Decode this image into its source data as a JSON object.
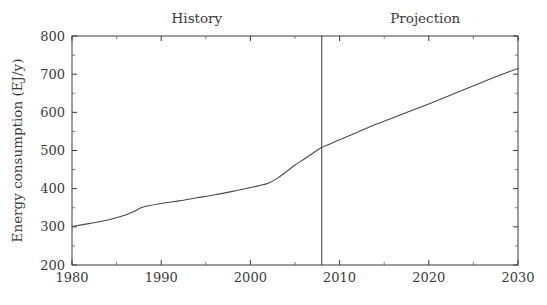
{
  "chart_data": {
    "type": "line",
    "title": "",
    "subtitle": "",
    "xlabel": "",
    "ylabel": "Energy consumption (EJ/y)",
    "xlim": [
      1980,
      2030
    ],
    "ylim": [
      200,
      800
    ],
    "grid": false,
    "legend_position": "none",
    "x_major_ticks": [
      1980,
      1990,
      2000,
      2010,
      2020,
      2030
    ],
    "x_major_tick_labels": [
      "1980",
      "1990",
      "2000",
      "2010",
      "2020",
      "2030"
    ],
    "x_minor_ticks": [
      1985,
      1995,
      2005,
      2015,
      2025
    ],
    "y_major_ticks": [
      200,
      300,
      400,
      500,
      600,
      700,
      800
    ],
    "y_major_tick_labels": [
      "200",
      "300",
      "400",
      "500",
      "600",
      "700",
      "800"
    ],
    "y_minor_ticks": [
      250,
      350,
      450,
      550,
      650,
      750
    ],
    "annotations": [
      {
        "text": "History",
        "x": 1994,
        "position": "above-axis"
      },
      {
        "text": "Projection",
        "x": 2019.6,
        "position": "above-axis"
      }
    ],
    "vertical_divider": {
      "x": 2008,
      "label": "history-projection boundary"
    },
    "series": [
      {
        "name": "Energy consumption",
        "color": "#4a4a4a",
        "x": [
          1980,
          1982,
          1984,
          1986,
          1987,
          1988,
          1990,
          1992,
          1994,
          1996,
          1998,
          1999,
          2000,
          2001,
          2002,
          2003,
          2004,
          2005,
          2006,
          2007,
          2008,
          2010,
          2012,
          2014,
          2016,
          2018,
          2020,
          2022,
          2024,
          2026,
          2028,
          2030
        ],
        "values": [
          301,
          309,
          318,
          331,
          341,
          352,
          361,
          368,
          376,
          384,
          393,
          398,
          403,
          408,
          414,
          427,
          444,
          462,
          477,
          493,
          508,
          528,
          548,
          568,
          586,
          604,
          622,
          641,
          660,
          679,
          698,
          715
        ]
      }
    ]
  }
}
